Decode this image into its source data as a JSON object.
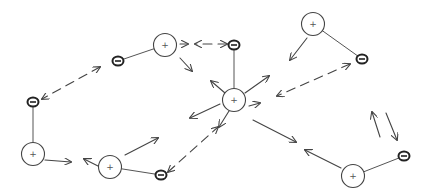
{
  "diagram": {
    "positive_label": "+",
    "negative_label": "−",
    "colors": {
      "ink": "#444444",
      "background": "#ffffff"
    },
    "dipoles": [
      {
        "id": "d1",
        "name": "top-left-dipole"
      },
      {
        "id": "d2",
        "name": "left-dipole"
      },
      {
        "id": "d3",
        "name": "bottom-center-dipole"
      },
      {
        "id": "d4",
        "name": "center-dipole"
      },
      {
        "id": "d5",
        "name": "top-right-dipole"
      },
      {
        "id": "d6",
        "name": "bottom-right-dipole"
      }
    ],
    "arrows": [
      {
        "id": "a1",
        "name": "arrow-neg-to-neg-left-1",
        "style": "double-dashed"
      },
      {
        "id": "a2",
        "name": "arrow-top-pos-to-right"
      },
      {
        "id": "a3",
        "name": "arrow-dashed-to-neg-top",
        "style": "dashed"
      },
      {
        "id": "a4",
        "name": "arrow-top-pos-down-right"
      },
      {
        "id": "a5",
        "name": "arrow-center-up-left"
      },
      {
        "id": "a6",
        "name": "arrow-center-up-right"
      },
      {
        "id": "a7",
        "name": "arrow-center-right"
      },
      {
        "id": "a8",
        "name": "arrow-center-left"
      },
      {
        "id": "a9",
        "name": "arrow-center-down-left"
      },
      {
        "id": "a10",
        "name": "arrow-center-down-right"
      },
      {
        "id": "a11",
        "name": "arrow-topright-pos-down-left"
      },
      {
        "id": "a12",
        "name": "arrow-dashed-neg-to-center",
        "style": "double-dashed"
      },
      {
        "id": "a13",
        "name": "arrow-neg-right-up"
      },
      {
        "id": "a14",
        "name": "arrow-down-to-neg-right"
      },
      {
        "id": "a15",
        "name": "arrow-bottomright-pos-left"
      },
      {
        "id": "a16",
        "name": "arrow-left-pos-right"
      },
      {
        "id": "a17",
        "name": "arrow-bottom-pos-left"
      },
      {
        "id": "a18",
        "name": "arrow-bottom-pos-up-right"
      },
      {
        "id": "a19",
        "name": "arrow-dashed-neg-to-center-bottom",
        "style": "double-dashed"
      },
      {
        "id": "a20",
        "name": "arrow-center-up-left-2"
      }
    ]
  }
}
